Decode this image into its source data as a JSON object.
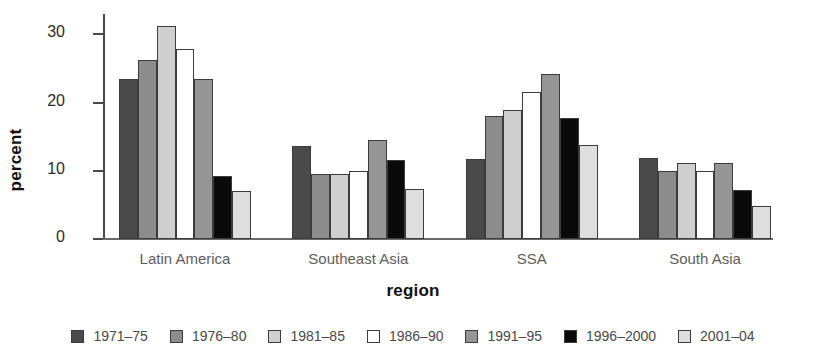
{
  "chart_data": {
    "type": "bar",
    "title": "",
    "xlabel": "region",
    "ylabel": "percent",
    "ylim": [
      0,
      33
    ],
    "yticks": [
      0,
      10,
      20,
      30
    ],
    "grid": false,
    "legend_position": "bottom",
    "categories": [
      "Latin America",
      "Southeast Asia",
      "SSA",
      "South Asia"
    ],
    "series": [
      {
        "name": "1971–75",
        "color": "#4a4a4a",
        "values": [
          23.5,
          13.6,
          11.8,
          11.9
        ]
      },
      {
        "name": "1976–80",
        "color": "#8c8c8c",
        "values": [
          26.2,
          9.6,
          18.0,
          10.0
        ]
      },
      {
        "name": "1981–85",
        "color": "#cfcfcf",
        "values": [
          31.2,
          9.6,
          18.9,
          11.2
        ]
      },
      {
        "name": "1986–90",
        "color": "#ffffff",
        "values": [
          27.8,
          10.0,
          21.5,
          10.0
        ]
      },
      {
        "name": "1991–95",
        "color": "#959595",
        "values": [
          23.5,
          14.5,
          24.2,
          11.1
        ]
      },
      {
        "name": "1996–2000",
        "color": "#0a0a0a",
        "values": [
          9.3,
          11.6,
          17.8,
          7.2
        ]
      },
      {
        "name": "2001–04",
        "color": "#dedede",
        "values": [
          7.0,
          7.4,
          13.8,
          4.8
        ]
      }
    ]
  },
  "axes": {
    "y_title": "percent",
    "x_title": "region",
    "y_tick_labels": [
      "0",
      "10",
      "20",
      "30"
    ],
    "x_tick_labels": [
      "Latin America",
      "Southeast Asia",
      "SSA",
      "South Asia"
    ]
  },
  "legend": {
    "entries": [
      {
        "label": "1971–75"
      },
      {
        "label": "1976–80"
      },
      {
        "label": "1981–85"
      },
      {
        "label": "1986–90"
      },
      {
        "label": "1991–95"
      },
      {
        "label": "1996–2000"
      },
      {
        "label": "2001–04"
      }
    ]
  }
}
